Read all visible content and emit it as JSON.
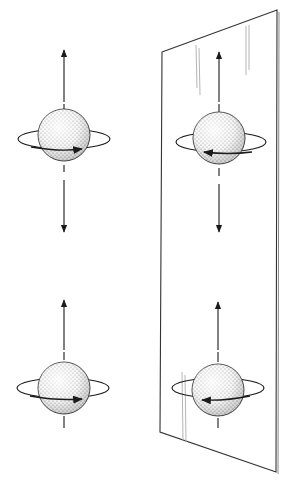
{
  "figure": {
    "colors": {
      "line": "#1a1a1a",
      "sphere_fill": "#ececec",
      "stipple": "#555555",
      "mirror_edge": "#333333",
      "mirror_streak": "#b5b5b5",
      "background": "#ffffff"
    },
    "panels": [
      {
        "id": "left-top",
        "label": "original",
        "spin_arrows": [
          "up",
          "down"
        ],
        "rotation_arrow": "right"
      },
      {
        "id": "right-top",
        "label": "mirror image",
        "spin_arrows": [
          "up",
          "down"
        ],
        "rotation_arrow": "left"
      },
      {
        "id": "left-bottom",
        "label": "original",
        "spin_arrows": [
          "up"
        ],
        "rotation_arrow": "right"
      },
      {
        "id": "right-bottom",
        "label": "mirror image",
        "spin_arrows": [
          "up"
        ],
        "rotation_arrow": "left"
      }
    ],
    "mirror": {
      "present": true
    }
  }
}
